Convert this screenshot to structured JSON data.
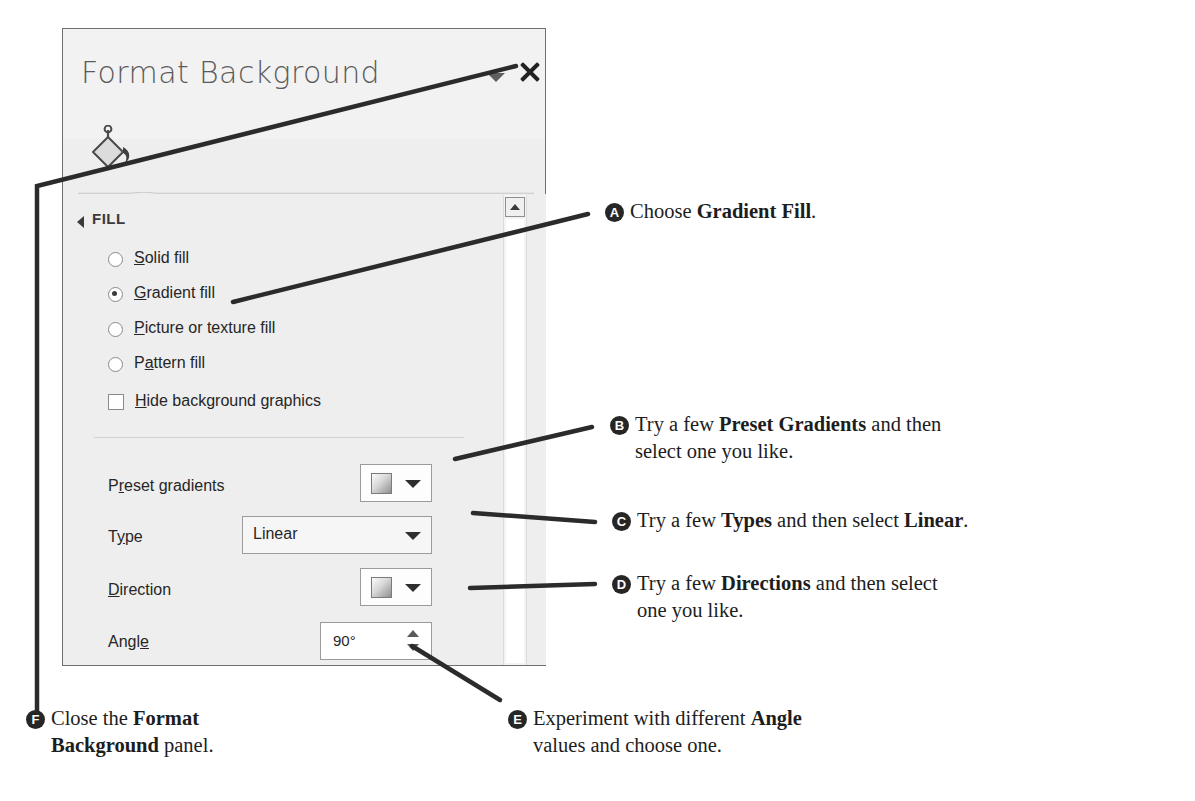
{
  "panel": {
    "title": "Format Background",
    "icon": "paint-bucket-icon",
    "chevron": "chevron-down-icon",
    "close": "close-icon",
    "section": {
      "label": "FILL",
      "expander": "collapse-triangle-icon"
    },
    "fill_options": [
      {
        "id": "solid",
        "label_pre": "",
        "label_key": "S",
        "label_post": "olid fill",
        "selected": false
      },
      {
        "id": "gradient",
        "label_pre": "",
        "label_key": "G",
        "label_post": "radient fill",
        "selected": true
      },
      {
        "id": "picture",
        "label_pre": "",
        "label_key": "P",
        "label_post": "icture or texture fill",
        "selected": false
      },
      {
        "id": "pattern",
        "label_pre": "P",
        "label_key": "a",
        "label_post": "ttern fill",
        "selected": false
      }
    ],
    "hide_background": {
      "label_key": "H",
      "label_post": "ide background graphics",
      "checked": false
    },
    "rows": [
      {
        "id": "preset-gradients",
        "label_pre": "P",
        "label_key": "r",
        "label_post": "eset gradients",
        "control": "swatch-dropdown",
        "value": ""
      },
      {
        "id": "type",
        "label_pre": "T",
        "label_key": "y",
        "label_post": "pe",
        "control": "combo-box",
        "value": "Linear"
      },
      {
        "id": "direction",
        "label_pre": "",
        "label_key": "D",
        "label_post": "irection",
        "control": "swatch-dropdown",
        "value": ""
      },
      {
        "id": "angle",
        "label_pre": "Angl",
        "label_key": "e",
        "label_post": "",
        "control": "spinner",
        "value": "90°"
      }
    ],
    "scrollbar": {
      "up_arrow": "scroll-up-icon"
    }
  },
  "callouts": [
    {
      "letter": "A",
      "line1_a": "Choose ",
      "line1_b": "Gradient Fill",
      "line1_c": ".",
      "line2": ""
    },
    {
      "letter": "B",
      "line1_a": "Try a few ",
      "line1_b": "Preset Gradients",
      "line1_c": " and then",
      "line2": "select one you like."
    },
    {
      "letter": "C",
      "line1_a": "Try a few ",
      "line1_b": "Types",
      "line1_c": " and then select ",
      "line1_d": "Linear",
      "line1_e": ".",
      "line2": ""
    },
    {
      "letter": "D",
      "line1_a": "Try a few ",
      "line1_b": "Directions",
      "line1_c": " and then select",
      "line2": "one you like."
    },
    {
      "letter": "E",
      "line1_a": "Experiment with different ",
      "line1_b": "Angle",
      "line1_c": "",
      "line2": "values and choose one."
    },
    {
      "letter": "F",
      "line1_a": "Close the ",
      "line1_b": "Format",
      "line1_c": "",
      "line2_b": "Background",
      "line2_c": " panel."
    }
  ],
  "colors": {
    "panel_bg": "#eeeeee",
    "panel_border": "#6f6f6f",
    "title_text": "#5b5b5b",
    "body_text": "#262626",
    "badge_bg": "#262626",
    "leader_line": "#2b2b2b"
  }
}
